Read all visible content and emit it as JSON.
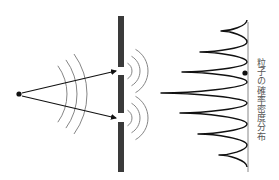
{
  "figure": {
    "label": "粒子の確率密度分布",
    "colors": {
      "background": "#ffffff",
      "ink": "#111111",
      "barrier": "#3a3a3a",
      "wave": "#777777",
      "screen": "#888888",
      "label": "#555555"
    }
  },
  "source": {
    "x": 19,
    "y": 94,
    "r": 2.6
  },
  "barrier": {
    "x": 118,
    "width": 6,
    "segments": [
      {
        "y1": 16,
        "y2": 67
      },
      {
        "y1": 75,
        "y2": 113
      },
      {
        "y1": 122,
        "y2": 172
      }
    ],
    "slits": [
      {
        "x": 121,
        "y": 71
      },
      {
        "x": 121,
        "y": 118
      }
    ]
  },
  "arrows": [
    {
      "x1": 22,
      "y1": 93,
      "x2": 116,
      "y2": 71
    },
    {
      "x1": 22,
      "y1": 96,
      "x2": 116,
      "y2": 118
    }
  ],
  "incident_waves": {
    "cx": 19,
    "cy": 94,
    "radii": [
      48,
      58,
      68
    ],
    "half_angle_deg": 36
  },
  "diffracted_waves": {
    "radii": [
      9,
      17,
      25
    ],
    "half_angle_deg": 60
  },
  "screen": {
    "x": 248,
    "y1": 22,
    "y2": 172
  },
  "detection_dot": {
    "x": 245,
    "y": 73,
    "r": 2.6
  },
  "chart_data": {
    "type": "line",
    "title": "粒子の確率密度分布",
    "orientation": "vertical (intensity extends left from screen)",
    "fringe_positions_y": [
      31,
      52,
      72,
      93,
      113,
      134,
      155
    ],
    "relative_intensity": [
      0.3,
      0.55,
      0.78,
      1.0,
      0.8,
      0.57,
      0.33
    ],
    "peak_tips": [
      {
        "x": 221,
        "y": 31
      },
      {
        "x": 200,
        "y": 52
      },
      {
        "x": 182,
        "y": 72
      },
      {
        "x": 161,
        "y": 93
      },
      {
        "x": 180,
        "y": 113
      },
      {
        "x": 198,
        "y": 134
      },
      {
        "x": 219,
        "y": 155
      }
    ],
    "valley_y": [
      20,
      42,
      62,
      82,
      103,
      124,
      145,
      167
    ],
    "baseline_x": 247
  }
}
